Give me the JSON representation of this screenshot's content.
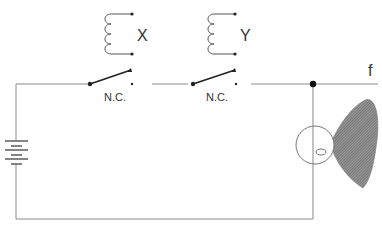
{
  "diagram": {
    "type": "circuit",
    "relays": [
      {
        "coil_label": "X",
        "contact_label": "N.C."
      },
      {
        "coil_label": "Y",
        "contact_label": "N.C."
      }
    ],
    "output_label": "f",
    "components": [
      "battery",
      "relay-coil-x",
      "relay-coil-y",
      "nc-contact-x",
      "nc-contact-y",
      "lamp",
      "light-beam"
    ],
    "colors": {
      "wire": "#8a8a8a",
      "contact": "#222222",
      "beam": "#666666"
    }
  }
}
